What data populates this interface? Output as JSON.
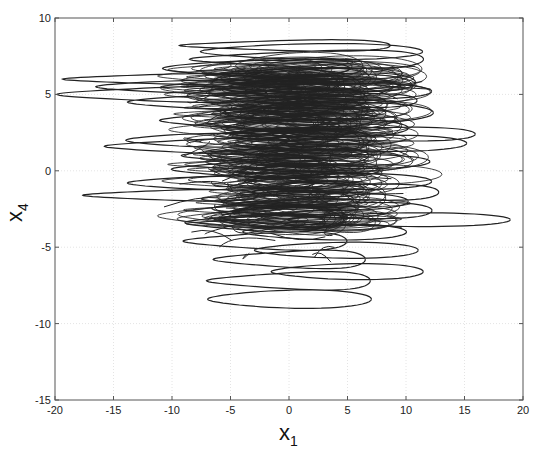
{
  "chart_data": {
    "type": "line",
    "title": "",
    "xlabel": "x",
    "xlabel_subscript": "1",
    "ylabel": "x",
    "ylabel_subscript": "4",
    "xlim": [
      -20,
      20
    ],
    "ylim": [
      -15,
      10
    ],
    "xticks": [
      -20,
      -15,
      -10,
      -5,
      0,
      5,
      10,
      15,
      20
    ],
    "yticks": [
      -15,
      -10,
      -5,
      0,
      5,
      10
    ],
    "xtick_labels": [
      "-20",
      "-15",
      "-10",
      "-5",
      "0",
      "5",
      "10",
      "15",
      "20"
    ],
    "ytick_labels": [
      "-15",
      "-10",
      "-5",
      "0",
      "5",
      "10"
    ],
    "grid": true,
    "legend": null,
    "line_color": "#222222",
    "extent": {
      "x_min": -18.5,
      "x_max": 17.5,
      "y_min": -9.3,
      "y_max": 8.6
    },
    "loops": [
      {
        "cx": 1,
        "cy": 8.2,
        "rx": 9,
        "ry": 0.5
      },
      {
        "cx": 0.5,
        "cy": 7.8,
        "rx": 9.5,
        "ry": 0.7
      },
      {
        "cx": 3,
        "cy": 7.3,
        "rx": 10,
        "ry": 0.8
      },
      {
        "cx": -4,
        "cy": 6.7,
        "rx": 8,
        "ry": 0.7
      },
      {
        "cx": -9,
        "cy": 6.0,
        "rx": 9,
        "ry": 0.5
      },
      {
        "cx": -8,
        "cy": 5.5,
        "rx": 10,
        "ry": 0.6
      },
      {
        "cx": -9.5,
        "cy": 5.0,
        "rx": 9,
        "ry": 0.7
      },
      {
        "cx": -7,
        "cy": 4.5,
        "rx": 8,
        "ry": 0.6
      },
      {
        "cx": 4,
        "cy": 5.8,
        "rx": 8,
        "ry": 0.8
      },
      {
        "cx": 3,
        "cy": 5.2,
        "rx": 8,
        "ry": 0.7
      },
      {
        "cx": 5,
        "cy": 4.6,
        "rx": 7,
        "ry": 0.6
      },
      {
        "cx": 2,
        "cy": 3.8,
        "rx": 9,
        "ry": 0.9
      },
      {
        "cx": -3,
        "cy": 3.3,
        "rx": 7,
        "ry": 0.8
      },
      {
        "cx": 1,
        "cy": 2.8,
        "rx": 8,
        "ry": 0.8
      },
      {
        "cx": 7,
        "cy": 2.4,
        "rx": 10.5,
        "ry": 0.6
      },
      {
        "cx": -8,
        "cy": 2.0,
        "rx": 7,
        "ry": 0.6
      },
      {
        "cx": -6,
        "cy": 1.6,
        "rx": 8.5,
        "ry": 0.7
      },
      {
        "cx": 6,
        "cy": 1.8,
        "rx": 8,
        "ry": 0.7
      },
      {
        "cx": 0,
        "cy": 1.0,
        "rx": 8,
        "ry": 0.8
      },
      {
        "cx": 4,
        "cy": 0.6,
        "rx": 7,
        "ry": 0.6
      },
      {
        "cx": -2,
        "cy": 0.1,
        "rx": 7,
        "ry": 0.8
      },
      {
        "cx": -7,
        "cy": -0.8,
        "rx": 8,
        "ry": 0.6
      },
      {
        "cx": -9,
        "cy": -1.6,
        "rx": 7.5,
        "ry": 0.5
      },
      {
        "cx": 3,
        "cy": -0.7,
        "rx": 8,
        "ry": 0.7
      },
      {
        "cx": 6,
        "cy": -1.4,
        "rx": 8,
        "ry": 0.7
      },
      {
        "cx": 1,
        "cy": -2.0,
        "rx": 8,
        "ry": 0.8
      },
      {
        "cx": 5,
        "cy": -2.6,
        "rx": 8.5,
        "ry": 0.7
      },
      {
        "cx": 8,
        "cy": -3.2,
        "rx": 9.5,
        "ry": 0.6
      },
      {
        "cx": -2,
        "cy": -3.4,
        "rx": 6,
        "ry": 0.8
      },
      {
        "cx": 2,
        "cy": -4.0,
        "rx": 7,
        "ry": 0.7
      },
      {
        "cx": -1,
        "cy": -4.6,
        "rx": 7,
        "ry": 0.8
      },
      {
        "cx": 3,
        "cy": -5.2,
        "rx": 7,
        "ry": 0.7
      },
      {
        "cx": 1,
        "cy": -5.8,
        "rx": 6.5,
        "ry": 0.8
      },
      {
        "cx": 4,
        "cy": -6.6,
        "rx": 6.5,
        "ry": 0.7
      },
      {
        "cx": 1,
        "cy": -7.2,
        "rx": 7,
        "ry": 0.8
      },
      {
        "cx": -1,
        "cy": -8.4,
        "rx": 7,
        "ry": 0.8
      }
    ]
  }
}
